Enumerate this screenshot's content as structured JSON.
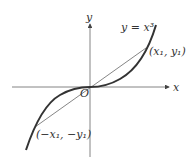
{
  "diagram": {
    "axes": {
      "x_label": "x",
      "y_label": "y",
      "origin_label": "O"
    },
    "curve_label": "y = x³",
    "points": [
      {
        "name": "p1",
        "label": "(x₁, y₁)"
      },
      {
        "name": "p2",
        "label": "(−x₁, −y₁)"
      }
    ],
    "colors": {
      "curve": "#333333",
      "axes": "#555555",
      "chord": "#555555"
    }
  }
}
